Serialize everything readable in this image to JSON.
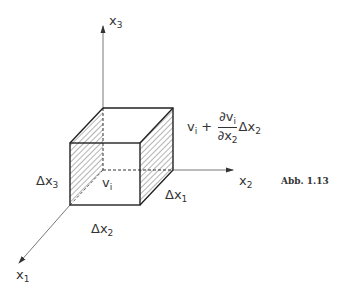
{
  "figure": {
    "caption": "Abb. 1.13",
    "axes": {
      "x1": {
        "name": "x",
        "index": "1"
      },
      "x2": {
        "name": "x",
        "index": "2"
      },
      "x3": {
        "name": "x",
        "index": "3"
      }
    },
    "labels": {
      "dx1": {
        "delta": "Δx",
        "index": "1"
      },
      "dx2": {
        "delta": "Δx",
        "index": "2"
      },
      "dx3": {
        "delta": "Δx",
        "index": "3"
      },
      "vi": {
        "name": "v",
        "index": "i"
      },
      "formula": {
        "base_name": "v",
        "base_index": "i",
        "plus": "+",
        "num_d": "∂v",
        "num_index": "i",
        "den_d": "∂x",
        "den_index": "2",
        "tail": "Δx",
        "tail_index": "2"
      }
    },
    "colors": {
      "line": "#333333",
      "hatch": "#444444",
      "background": "#ffffff"
    }
  }
}
